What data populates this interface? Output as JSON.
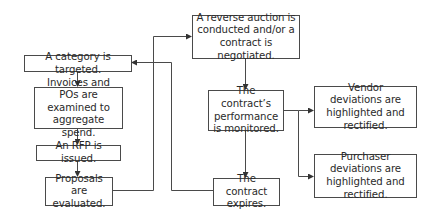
{
  "diagram": {
    "type": "flowchart",
    "nodes": [
      {
        "id": "category",
        "label": "A category is targeted."
      },
      {
        "id": "invoices",
        "label": "Invoices and POs are examined to aggregate spend."
      },
      {
        "id": "rfp",
        "label": "An RFP is issued."
      },
      {
        "id": "proposals",
        "label": "Proposals are evaluated."
      },
      {
        "id": "auction",
        "label": "A reverse auction is conducted and/or a contract is negotiated."
      },
      {
        "id": "monitor",
        "label": "The contract’s performance is monitored."
      },
      {
        "id": "expires",
        "label": "The contract expires."
      },
      {
        "id": "vendor",
        "label": "Vendor deviations are highlighted and rectified."
      },
      {
        "id": "purchaser",
        "label": "Purchaser deviations are highlighted and rectified."
      }
    ],
    "edges": [
      {
        "from": "category",
        "to": "invoices"
      },
      {
        "from": "invoices",
        "to": "rfp"
      },
      {
        "from": "rfp",
        "to": "proposals"
      },
      {
        "from": "proposals",
        "to": "auction"
      },
      {
        "from": "auction",
        "to": "monitor"
      },
      {
        "from": "monitor",
        "to": "vendor"
      },
      {
        "from": "monitor",
        "to": "purchaser"
      },
      {
        "from": "monitor",
        "to": "expires"
      },
      {
        "from": "expires",
        "to": "category"
      }
    ],
    "colors": {
      "line": "#4a4a4a",
      "text": "#2a2a2a",
      "background": "#ffffff"
    }
  }
}
